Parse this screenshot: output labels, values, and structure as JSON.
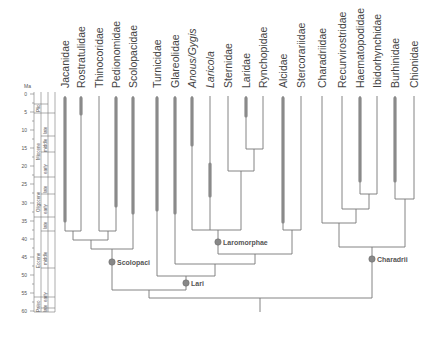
{
  "figure": {
    "type": "time-calibrated phylogeny",
    "axis": {
      "unit_label": "Ma",
      "ticks": [
        0,
        5,
        10,
        15,
        20,
        25,
        30,
        35,
        40,
        45,
        50,
        55,
        60
      ],
      "y_of_zero": 94,
      "px_per_ma": 3.62
    },
    "timescale": {
      "epochs": [
        {
          "name": "Plio",
          "from": 2.6,
          "to": 5.3
        },
        {
          "name": "Miocene",
          "from": 5.3,
          "to": 23
        },
        {
          "name": "Oligocene",
          "from": 23,
          "to": 34
        },
        {
          "name": "Eocene",
          "from": 34,
          "to": 56
        },
        {
          "name": "Paleo",
          "from": 56,
          "to": 61
        }
      ],
      "subdivisions": [
        {
          "name": "late",
          "from": 5.3,
          "to": 11.6
        },
        {
          "name": "middle",
          "from": 11.6,
          "to": 16
        },
        {
          "name": "early",
          "from": 16,
          "to": 23
        },
        {
          "name": "late",
          "from": 23,
          "to": 28
        },
        {
          "name": "early",
          "from": 28,
          "to": 34
        },
        {
          "name": "late",
          "from": 34,
          "to": 38
        },
        {
          "name": "middle",
          "from": 38,
          "to": 48
        },
        {
          "name": "early",
          "from": 48,
          "to": 56
        },
        {
          "name": "late",
          "from": 56,
          "to": 59
        }
      ]
    },
    "taxa": [
      {
        "name": "Jacanidae",
        "x": 65,
        "italic": false,
        "fossil_from": 0,
        "fossil_to": 35
      },
      {
        "name": "Rostratulidae",
        "x": 81,
        "italic": false,
        "fossil_from": 0,
        "fossil_to": 5
      },
      {
        "name": "Thinocoridae",
        "x": 99,
        "italic": false,
        "fossil_from": null,
        "fossil_to": null
      },
      {
        "name": "Pedionomidae",
        "x": 116,
        "italic": false,
        "fossil_from": 0,
        "fossil_to": 31
      },
      {
        "name": "Scolopacidae",
        "x": 133,
        "italic": false,
        "fossil_from": 0,
        "fossil_to": 34
      },
      {
        "name": "Turnicidae",
        "x": 157,
        "italic": false,
        "fossil_from": 0,
        "fossil_to": 32
      },
      {
        "name": "Glareolidae",
        "x": 175,
        "italic": false,
        "fossil_from": 0,
        "fossil_to": 33
      },
      {
        "name": "Anous/Gygis",
        "x": 192,
        "italic": true,
        "fossil_from": 0,
        "fossil_to": 12
      },
      {
        "name": "Laricola",
        "x": 210,
        "italic": true,
        "fossil_from": 17,
        "fossil_to": 28
      },
      {
        "name": "Sternidae",
        "x": 228,
        "italic": false,
        "fossil_from": null,
        "fossil_to": null
      },
      {
        "name": "Laridae",
        "x": 246,
        "italic": false,
        "fossil_from": 0,
        "fossil_to": 5
      },
      {
        "name": "Rynchopidae",
        "x": 263,
        "italic": false,
        "fossil_from": null,
        "fossil_to": null
      },
      {
        "name": "Alcidae",
        "x": 283,
        "italic": false,
        "fossil_from": 0,
        "fossil_to": 35
      },
      {
        "name": "Stercorariidae",
        "x": 301,
        "italic": false,
        "fossil_from": null,
        "fossil_to": null
      },
      {
        "name": "Charadriidae",
        "x": 322,
        "italic": false,
        "fossil_from": null,
        "fossil_to": null
      },
      {
        "name": "Recurvirostridae",
        "x": 342,
        "italic": false,
        "fossil_from": null,
        "fossil_to": null
      },
      {
        "name": "Haematopodidae",
        "x": 360,
        "italic": false,
        "fossil_from": 0,
        "fossil_to": 26
      },
      {
        "name": "Ibidorhynchidae",
        "x": 377,
        "italic": false,
        "fossil_from": null,
        "fossil_to": null
      },
      {
        "name": "Burhinidae",
        "x": 395,
        "italic": false,
        "fossil_from": 0,
        "fossil_to": 26
      },
      {
        "name": "Chionidae",
        "x": 414,
        "italic": false,
        "fossil_from": null,
        "fossil_to": null
      }
    ],
    "node_labels": [
      {
        "name": "Scolopaci",
        "x": 110,
        "y": 262
      },
      {
        "name": "Lari",
        "x": 186,
        "y": 283
      },
      {
        "name": "Laromorphae",
        "x": 218,
        "y": 242
      },
      {
        "name": "Charadrii",
        "x": 372,
        "y": 259
      }
    ]
  }
}
